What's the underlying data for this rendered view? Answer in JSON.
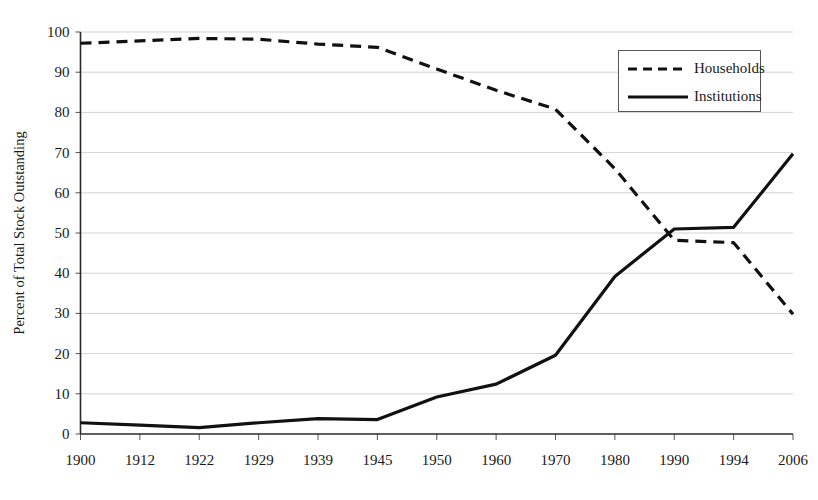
{
  "chart_data": {
    "type": "line",
    "title": "",
    "xlabel": "",
    "ylabel": "Percent of Total Stock Outstanding",
    "categories": [
      "1900",
      "1912",
      "1922",
      "1929",
      "1939",
      "1945",
      "1950",
      "1960",
      "1970",
      "1980",
      "1990",
      "1994",
      "2006"
    ],
    "ylim": [
      0,
      100
    ],
    "ytick_labels": [
      "0",
      "10",
      "20",
      "30",
      "40",
      "50",
      "60",
      "70",
      "80",
      "90",
      "100"
    ],
    "ytick_values": [
      0,
      10,
      20,
      30,
      40,
      50,
      60,
      70,
      80,
      90,
      100
    ],
    "grid": true,
    "legend_position": "upper-right",
    "series": [
      {
        "name": "Households",
        "style": "dashed",
        "color": "#111111",
        "values": [
          97.2,
          97.8,
          98.4,
          98.2,
          97.0,
          96.2,
          90.8,
          85.5,
          80.8,
          66.0,
          48.2,
          47.6,
          29.8
        ]
      },
      {
        "name": "Institutions",
        "style": "solid",
        "color": "#111111",
        "values": [
          2.8,
          2.2,
          1.6,
          2.8,
          3.8,
          3.6,
          9.2,
          12.4,
          19.6,
          39.2,
          51.0,
          51.4,
          69.7
        ]
      }
    ]
  },
  "legend": {
    "items": [
      {
        "label": "Households",
        "style": "dashed"
      },
      {
        "label": "Institutions",
        "style": "solid"
      }
    ]
  },
  "axes": {
    "y_axis_title": "Percent of Total Stock Outstanding"
  }
}
